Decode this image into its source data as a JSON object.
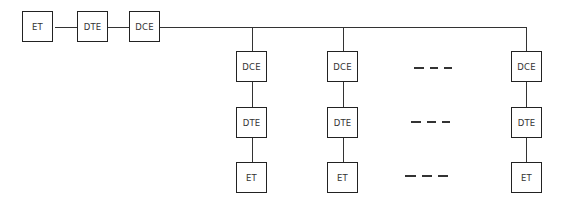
{
  "diagram": {
    "type": "network-topology",
    "main_chain": [
      "ET",
      "DTE",
      "DCE"
    ],
    "drops": [
      {
        "dce": "DCE",
        "dte": "DTE",
        "et": "ET"
      },
      {
        "dce": "DCE",
        "dte": "DTE",
        "et": "ET"
      },
      {
        "dce": "DCE",
        "dte": "DTE",
        "et": "ET"
      }
    ],
    "ellipsis": "- - -"
  }
}
